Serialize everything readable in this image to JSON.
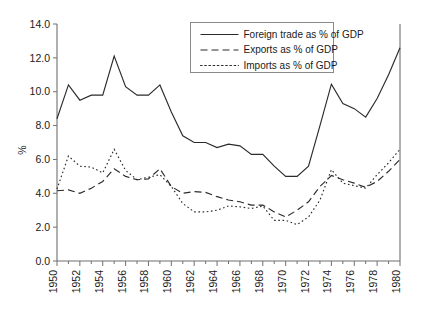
{
  "chart_data": {
    "type": "line",
    "title": "",
    "subtitle": "",
    "xlabel": "",
    "ylabel": "%",
    "ylim": [
      0.0,
      14.0
    ],
    "xlim": [
      1950,
      1980
    ],
    "grid": false,
    "legend_position": "top-right",
    "ytick_labels": [
      "0.0",
      "2.0",
      "4.0",
      "6.0",
      "8.0",
      "10.0",
      "12.0",
      "14.0"
    ],
    "ytick_values": [
      0.0,
      2.0,
      4.0,
      6.0,
      8.0,
      10.0,
      12.0,
      14.0
    ],
    "xtick_labels": [
      "1950",
      "1952",
      "1954",
      "1956",
      "1958",
      "1960",
      "1962",
      "1964",
      "1966",
      "1968",
      "1970",
      "1972",
      "1974",
      "1976",
      "1978",
      "1980"
    ],
    "xtick_values": [
      1950,
      1952,
      1954,
      1956,
      1958,
      1960,
      1962,
      1964,
      1966,
      1968,
      1970,
      1972,
      1974,
      1976,
      1978,
      1980
    ],
    "x": [
      1950,
      1951,
      1952,
      1953,
      1954,
      1955,
      1956,
      1957,
      1958,
      1959,
      1960,
      1961,
      1962,
      1963,
      1964,
      1965,
      1966,
      1967,
      1968,
      1969,
      1970,
      1971,
      1972,
      1973,
      1974,
      1975,
      1976,
      1977,
      1978,
      1979,
      1980
    ],
    "series": [
      {
        "name": "Foreign trade as % of GDP",
        "style": "solid",
        "values": [
          8.4,
          10.4,
          9.5,
          9.8,
          9.8,
          12.1,
          10.3,
          9.8,
          9.8,
          10.4,
          8.8,
          7.4,
          7.0,
          7.0,
          6.7,
          6.9,
          6.8,
          6.3,
          6.3,
          5.6,
          5.0,
          5.0,
          5.6,
          8.0,
          10.45,
          9.3,
          9.0,
          8.5,
          9.6,
          11.0,
          12.6
        ]
      },
      {
        "name": "Exports as % of GDP",
        "style": "dashed",
        "values": [
          4.15,
          4.2,
          4.0,
          4.3,
          4.7,
          5.45,
          5.0,
          4.8,
          4.85,
          5.45,
          4.4,
          4.0,
          4.1,
          4.05,
          3.8,
          3.6,
          3.5,
          3.3,
          3.3,
          2.9,
          2.6,
          3.0,
          3.5,
          4.4,
          5.05,
          4.8,
          4.6,
          4.35,
          4.7,
          5.3,
          6.0
        ]
      },
      {
        "name": "Imports as % of GDP",
        "style": "dotted",
        "values": [
          4.25,
          6.2,
          5.6,
          5.55,
          5.2,
          6.6,
          5.35,
          4.8,
          4.95,
          5.1,
          4.4,
          3.4,
          2.9,
          2.9,
          3.0,
          3.25,
          3.2,
          3.1,
          3.25,
          2.4,
          2.4,
          2.15,
          2.6,
          3.6,
          5.4,
          4.6,
          4.45,
          4.3,
          5.1,
          5.8,
          6.6
        ]
      }
    ]
  },
  "legend": {
    "entries": [
      {
        "label": "Foreign trade as % of GDP",
        "style": "solid"
      },
      {
        "label": "Exports as % of GDP",
        "style": "dashed"
      },
      {
        "label": "Imports as % of GDP",
        "style": "dotted"
      }
    ]
  },
  "colors": {
    "line": "#2b2b2b",
    "axis": "#6f6f6f",
    "background": "#ffffff",
    "legend_border": "#8a8a8a"
  }
}
